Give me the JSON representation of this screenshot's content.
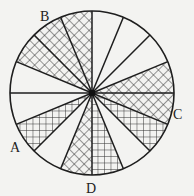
{
  "diagram": {
    "type": "circle divided into 16 equal sectors",
    "center": [
      92,
      93
    ],
    "radius": 82,
    "sector_count": 16,
    "sector_angle_deg": 22.5,
    "colors": {
      "line": "#1e1e1e",
      "background": "#f3f3f1",
      "hatch": "#333333"
    },
    "sectors": [
      {
        "index": 0,
        "start": 0,
        "end": 22.5,
        "fill": "diagonal"
      },
      {
        "index": 1,
        "start": 22.5,
        "end": 45,
        "fill": "none"
      },
      {
        "index": 2,
        "start": 45,
        "end": 67.5,
        "fill": "none"
      },
      {
        "index": 3,
        "start": 67.5,
        "end": 90,
        "fill": "none"
      },
      {
        "index": 4,
        "start": 90,
        "end": 112.5,
        "fill": "diagonal"
      },
      {
        "index": 5,
        "start": 112.5,
        "end": 135,
        "fill": "diagonal"
      },
      {
        "index": 6,
        "start": 135,
        "end": 157.5,
        "fill": "diagonal"
      },
      {
        "index": 7,
        "start": 157.5,
        "end": 180,
        "fill": "none"
      },
      {
        "index": 8,
        "start": 180,
        "end": 202.5,
        "fill": "none"
      },
      {
        "index": 9,
        "start": 202.5,
        "end": 225,
        "fill": "grid"
      },
      {
        "index": 10,
        "start": 225,
        "end": 247.5,
        "fill": "none"
      },
      {
        "index": 11,
        "start": 247.5,
        "end": 270,
        "fill": "diagonal"
      },
      {
        "index": 12,
        "start": 270,
        "end": 292.5,
        "fill": "grid"
      },
      {
        "index": 13,
        "start": 292.5,
        "end": 315,
        "fill": "none"
      },
      {
        "index": 14,
        "start": 315,
        "end": 337.5,
        "fill": "grid"
      },
      {
        "index": 15,
        "start": 337.5,
        "end": 360,
        "fill": "diagonal"
      }
    ],
    "labels": [
      {
        "text": "B",
        "x": 40,
        "y": 21
      },
      {
        "text": "A",
        "x": 10,
        "y": 152
      },
      {
        "text": "D",
        "x": 86,
        "y": 193
      },
      {
        "text": "C",
        "x": 173,
        "y": 119
      }
    ]
  }
}
